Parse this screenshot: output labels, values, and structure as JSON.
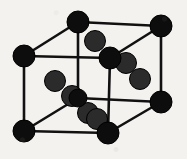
{
  "figure": {
    "background_color": "#f4f2ef",
    "bond_color": "#111111",
    "bond_width": 2.6,
    "corner_atom_color": "#0d0d0d",
    "interior_atom_color": "#2b2b2b",
    "atom_outline_color": "#000000",
    "corner_atom_radius": 11,
    "interior_atom_radius": 10.5,
    "canvas": {
      "width": 187,
      "height": 159
    }
  },
  "lattice": {
    "corner_atoms": [
      {
        "id": "back-top-left",
        "x": 78,
        "y": 22,
        "r": 11
      },
      {
        "id": "back-top-right",
        "x": 161,
        "y": 26,
        "r": 11
      },
      {
        "id": "front-top-left",
        "x": 24,
        "y": 56,
        "r": 11
      },
      {
        "id": "front-top-right",
        "x": 110,
        "y": 58,
        "r": 11
      },
      {
        "id": "back-bottom-left",
        "x": 78,
        "y": 98,
        "r": 9
      },
      {
        "id": "back-bottom-right",
        "x": 161,
        "y": 102,
        "r": 11
      },
      {
        "id": "front-bottom-left",
        "x": 24,
        "y": 131,
        "r": 11
      },
      {
        "id": "front-bottom-right",
        "x": 108,
        "y": 133,
        "r": 11
      }
    ],
    "interior_atoms": [
      {
        "id": "chain-a-1",
        "x": 95,
        "y": 41,
        "r": 10.5
      },
      {
        "id": "chain-a-2",
        "x": 126,
        "y": 63,
        "r": 10.5
      },
      {
        "id": "chain-a-3",
        "x": 140,
        "y": 79,
        "r": 10.5
      },
      {
        "id": "chain-b-1",
        "x": 55,
        "y": 81,
        "r": 10.5
      },
      {
        "id": "chain-b-2",
        "x": 72,
        "y": 96,
        "r": 10.5
      },
      {
        "id": "chain-b-3",
        "x": 88,
        "y": 113,
        "r": 10.5
      },
      {
        "id": "chain-c-1",
        "x": 97,
        "y": 119,
        "r": 10.5
      }
    ],
    "bonds": [
      {
        "id": "top-back-edge",
        "x1": 78,
        "y1": 22,
        "x2": 161,
        "y2": 26
      },
      {
        "id": "top-left-diagonal",
        "x1": 78,
        "y1": 22,
        "x2": 24,
        "y2": 56
      },
      {
        "id": "top-right-diagonal",
        "x1": 161,
        "y1": 26,
        "x2": 110,
        "y2": 58
      },
      {
        "id": "top-front-edge",
        "x1": 24,
        "y1": 56,
        "x2": 110,
        "y2": 58
      },
      {
        "id": "back-left-vertical",
        "x1": 78,
        "y1": 22,
        "x2": 78,
        "y2": 98
      },
      {
        "id": "back-right-vertical",
        "x1": 161,
        "y1": 26,
        "x2": 161,
        "y2": 102
      },
      {
        "id": "front-left-vertical",
        "x1": 24,
        "y1": 56,
        "x2": 24,
        "y2": 131
      },
      {
        "id": "front-right-vertical",
        "x1": 110,
        "y1": 58,
        "x2": 108,
        "y2": 133
      },
      {
        "id": "bottom-back-edge",
        "x1": 78,
        "y1": 98,
        "x2": 161,
        "y2": 102
      },
      {
        "id": "bottom-left-diagonal",
        "x1": 78,
        "y1": 98,
        "x2": 24,
        "y2": 131
      },
      {
        "id": "bottom-right-diagonal",
        "x1": 161,
        "y1": 102,
        "x2": 108,
        "y2": 133
      },
      {
        "id": "bottom-front-edge",
        "x1": 24,
        "y1": 131,
        "x2": 108,
        "y2": 133
      }
    ]
  }
}
